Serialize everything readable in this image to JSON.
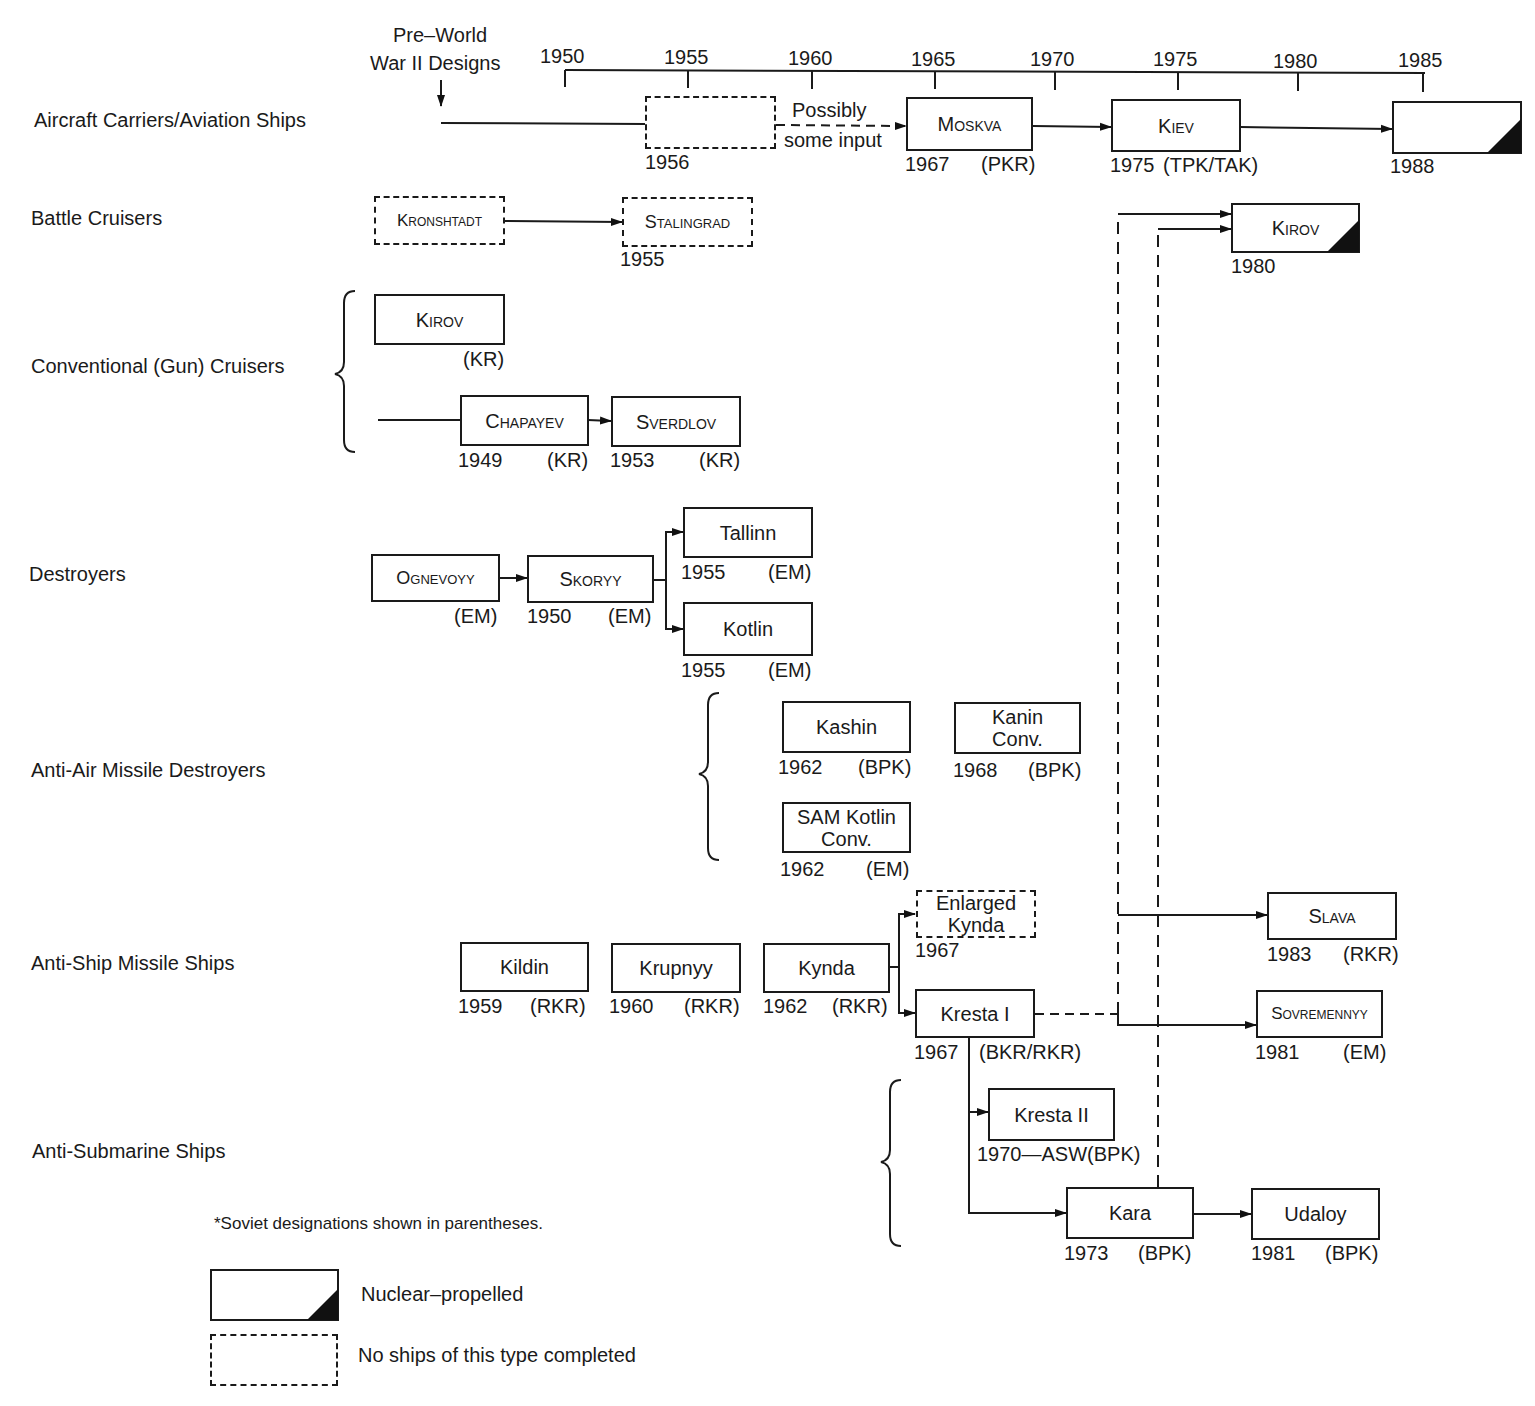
{
  "header": {
    "pre_ww2": [
      "Pre–World",
      "War II Designs"
    ]
  },
  "timeline": {
    "ticks": [
      "1950",
      "1955",
      "1960",
      "1965",
      "1970",
      "1975",
      "1980",
      "1985"
    ]
  },
  "categories": [
    "Aircraft Carriers/Aviation Ships",
    "Battle Cruisers",
    "Conventional (Gun) Cruisers",
    "Destroyers",
    "Anti-Air Missile Destroyers",
    "Anti-Ship Missile Ships",
    "Anti-Submarine Ships"
  ],
  "ships": {
    "carrier_1956": {
      "name": "",
      "year": "1956",
      "designation": ""
    },
    "possibly_note": [
      "Possibly",
      "some input"
    ],
    "moskva": {
      "name": "Moskva",
      "year": "1967",
      "designation": "(PKR)"
    },
    "kiev": {
      "name": "Kiev",
      "year": "1975",
      "designation": "(TPK/TAK)"
    },
    "carrier_1988": {
      "name": "",
      "year": "1988",
      "designation": ""
    },
    "kronshtadt": {
      "name": "Kronshtadt"
    },
    "stalingrad": {
      "name": "Stalingrad",
      "year": "1955"
    },
    "kirov_bc": {
      "name": "Kirov",
      "year": "1980"
    },
    "kirov_kr": {
      "name": "Kirov",
      "designation": "(KR)"
    },
    "chapayev": {
      "name": "Chapayev",
      "year": "1949",
      "designation": "(KR)"
    },
    "sverdlov": {
      "name": "Sverdlov",
      "year": "1953",
      "designation": "(KR)"
    },
    "ognevoyy": {
      "name": "Ognevoyy",
      "designation": "(EM)"
    },
    "skoryy": {
      "name": "Skoryy",
      "year": "1950",
      "designation": "(EM)"
    },
    "tallinn": {
      "name": "Tallinn",
      "year": "1955",
      "designation": "(EM)"
    },
    "kotlin": {
      "name": "Kotlin",
      "year": "1955",
      "designation": "(EM)"
    },
    "kashin": {
      "name": "Kashin",
      "year": "1962",
      "designation": "(BPK)"
    },
    "kanin": {
      "name": [
        "Kanin",
        "Conv."
      ],
      "year": "1968",
      "designation": "(BPK)"
    },
    "sam_kotlin": {
      "name": [
        "SAM Kotlin",
        "Conv."
      ],
      "year": "1962",
      "designation": "(EM)"
    },
    "enlarged_kynda": {
      "name": [
        "Enlarged",
        "Kynda"
      ],
      "year": "1967"
    },
    "kildin": {
      "name": "Kildin",
      "year": "1959",
      "designation": "(RKR)"
    },
    "krupnyy": {
      "name": "Krupnyy",
      "year": "1960",
      "designation": "(RKR)"
    },
    "kynda": {
      "name": "Kynda",
      "year": "1962",
      "designation": "(RKR)"
    },
    "kresta1": {
      "name": "Kresta I",
      "year": "1967",
      "designation": "(BKR/RKR)"
    },
    "slava": {
      "name": "Slava",
      "year": "1983",
      "designation": "(RKR)"
    },
    "sovremennyy": {
      "name": "Sovremennyy",
      "year": "1981",
      "designation": "(EM)"
    },
    "kresta2": {
      "name": "Kresta II",
      "caption": "1970—ASW(BPK)"
    },
    "kara": {
      "name": "Kara",
      "year": "1973",
      "designation": "(BPK)"
    },
    "udaloy": {
      "name": "Udaloy",
      "year": "1981",
      "designation": "(BPK)"
    }
  },
  "footnote": "*Soviet designations shown in parentheses.",
  "legend": {
    "nuclear": "Nuclear–propelled",
    "not_completed": "No ships of this type completed"
  }
}
